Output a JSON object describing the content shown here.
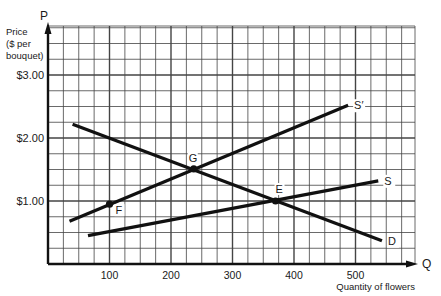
{
  "chart_data": {
    "type": "line",
    "title": "",
    "xlabel": "Quantity of flowers",
    "ylabel": "Price ($ per bouquet)",
    "x_axis_symbol": "Q",
    "y_axis_symbol": "P",
    "xlim": [
      0,
      600
    ],
    "ylim": [
      0,
      3.75
    ],
    "x_ticks": [
      100,
      200,
      300,
      400,
      500
    ],
    "x_tick_labels": [
      "100",
      "200",
      "300",
      "400",
      "500"
    ],
    "y_ticks": [
      1,
      2,
      3
    ],
    "y_tick_labels": [
      "$1.00",
      "$2.00",
      "$3.00"
    ],
    "ylabel_lines": [
      "Price",
      "($ per",
      "bouquet)"
    ],
    "grid": true,
    "grid_minor_x_step": 25,
    "grid_minor_y_step": 0.25,
    "series": [
      {
        "name": "D",
        "label": "D",
        "x": [
          40,
          543
        ],
        "y": [
          2.22,
          0.37
        ]
      },
      {
        "name": "S",
        "label": "S",
        "x": [
          65,
          537
        ],
        "y": [
          0.45,
          1.32
        ]
      },
      {
        "name": "S'",
        "label": "S′",
        "x": [
          35,
          488
        ],
        "y": [
          0.68,
          2.52
        ]
      }
    ],
    "points": [
      {
        "label": "F",
        "x": 100,
        "y": 0.95
      },
      {
        "label": "G",
        "x": 237,
        "y": 1.51
      },
      {
        "label": "E",
        "x": 370,
        "y": 1.0
      }
    ],
    "colors": {
      "line": "#111111",
      "grid": "#444444",
      "axis": "#111111"
    }
  }
}
